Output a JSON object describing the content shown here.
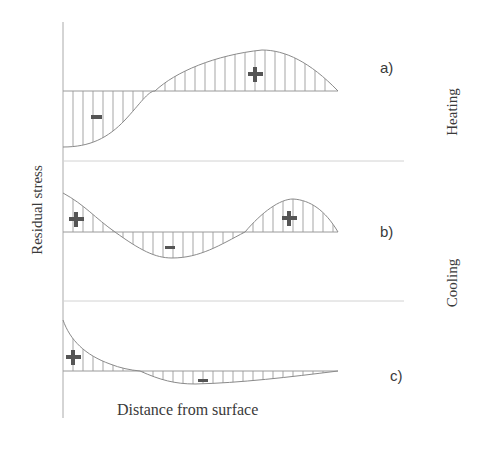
{
  "figure": {
    "y_axis_label": "Residual stress",
    "x_axis_label": "Distance from surface",
    "groups": [
      {
        "label": "Heating",
        "panels": [
          "a"
        ]
      },
      {
        "label": "Cooling",
        "panels": [
          "b",
          "c"
        ]
      }
    ],
    "panels": [
      {
        "id": "a",
        "label": "a)",
        "description": "Compressive (-) near surface, tensile (+) deeper",
        "signs": [
          {
            "symbol": "−",
            "x": 96,
            "y": 117
          },
          {
            "symbol": "+",
            "x": 255,
            "y": 74
          }
        ]
      },
      {
        "id": "b",
        "label": "b)",
        "description": "Tensile (+) at surface, compressive (-) in middle, tensile (+) deeper",
        "signs": [
          {
            "symbol": "+",
            "x": 76,
            "y": 219
          },
          {
            "symbol": "−",
            "x": 170,
            "y": 247
          },
          {
            "symbol": "+",
            "x": 289,
            "y": 218
          }
        ]
      },
      {
        "id": "c",
        "label": "c)",
        "description": "Tensile (+) at surface decaying, shallow compressive (-) deeper",
        "signs": [
          {
            "symbol": "+",
            "x": 73,
            "y": 355
          },
          {
            "symbol": "−",
            "x": 203,
            "y": 380
          }
        ]
      }
    ],
    "colors": {
      "curve": "#8a8a8a",
      "hatch": "#9a9a9a",
      "axis": "#aaaaaa",
      "separator": "#cfcfcf",
      "sign": "#555555",
      "text": "#3a3a3a"
    }
  }
}
